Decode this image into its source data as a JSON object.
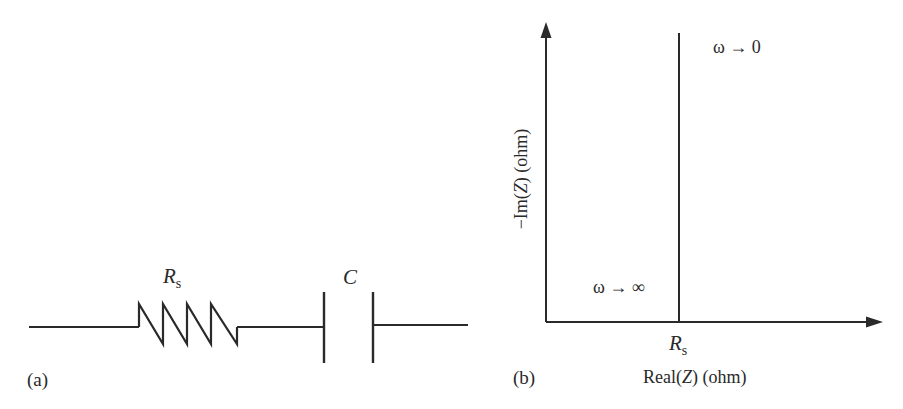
{
  "panel_a": {
    "label": "(a)",
    "resistor": {
      "symbol": "R",
      "subscript": "s"
    },
    "capacitor": {
      "symbol": "C"
    }
  },
  "panel_b": {
    "label": "(b)",
    "x_axis": {
      "prefix": "Real(",
      "var": "Z",
      "suffix": ") (ohm)"
    },
    "y_axis": {
      "prefix": "−Im(",
      "var": "Z",
      "suffix": ") (ohm)"
    },
    "x_tick": {
      "symbol": "R",
      "subscript": "s"
    },
    "annotation_low_freq": "ω → 0",
    "annotation_high_freq": "ω → ∞"
  },
  "colors": {
    "line": "#2a2a2a",
    "background": "#ffffff"
  }
}
